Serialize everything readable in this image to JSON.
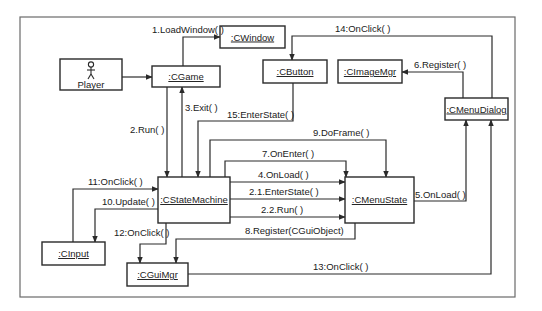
{
  "diagram": {
    "type": "UML collaboration diagram",
    "actor": {
      "label": "Player"
    },
    "objects": {
      "cgame": ":CGame",
      "cwindow": ":CWindow",
      "cbutton": ":CButton",
      "cimagemgr": ":CImageMgr",
      "cmenudialog": ":CMenuDialog",
      "cstatemachine": ":CStateMachine",
      "cmenustate": ":CMenuState",
      "cinput": ":CInput",
      "cguimgr": ":CGuiMgr"
    },
    "messages": {
      "m1": "1.LoadWindow( )",
      "m2": "2.Run( )",
      "m2_1": "2.1.EnterState( )",
      "m2_2": "2.2.Run( )",
      "m3": "3.Exit( )",
      "m4": "4.OnLoad( )",
      "m5": "5.OnLoad( )",
      "m6": "6.Register( )",
      "m7": "7.OnEnter( )",
      "m8": "8.Register(CGuiObject)",
      "m9": "9.DoFrame( )",
      "m10": "10.Update( )",
      "m11": "11:OnClick( )",
      "m12": "12:OnClick( )",
      "m13": "13:OnClick( )",
      "m14": "14:OnClick( )",
      "m15": "15:EnterState( )"
    },
    "colors": {
      "line": "#2a2a2a",
      "frame": "#6a6a6a",
      "background": "#ffffff"
    }
  }
}
